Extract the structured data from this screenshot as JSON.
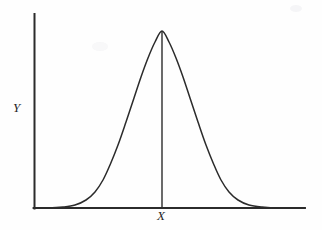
{
  "figure": {
    "name": "normal-distribution-curve",
    "background_color": "#fefefe",
    "line_color": "#2b2b2b",
    "width": 322,
    "height": 230
  },
  "labels": {
    "y_axis": "Y",
    "x_axis": "X"
  },
  "chart_data": {
    "type": "line",
    "title": "",
    "subtitle": "",
    "xlabel": "X",
    "ylabel": "Y",
    "legend": [],
    "grid": false,
    "axes": {
      "x_axis_pixel_y": 208,
      "y_axis_pixel_x": 34,
      "x_axis_start_px": 34,
      "x_axis_end_px": 305,
      "y_axis_top_px": 14,
      "y_axis_bottom_px": 208,
      "tick_labels_x": [],
      "tick_labels_y": [],
      "xlim": [
        -4.0,
        4.0
      ],
      "ylim": [
        0,
        1.0
      ]
    },
    "annotations": [
      {
        "name": "mean-vertical-line",
        "description": "vertical line from curve peak down to x-axis at the mean",
        "x": 0.0,
        "y_from": 0.0,
        "y_to": 1.0,
        "pixel_x": 162,
        "pixel_y_top": 31,
        "pixel_y_bottom": 208
      }
    ],
    "series": [
      {
        "name": "normal-density",
        "description": "symmetric bell-shaped normal distribution curve",
        "mean": 0.0,
        "std_dev": 1.0,
        "peak_value": 1.0,
        "x": [
          -4.0,
          -3.6,
          -3.2,
          -2.8,
          -2.4,
          -2.0,
          -1.6,
          -1.2,
          -0.8,
          -0.4,
          0.0,
          0.4,
          0.8,
          1.2,
          1.6,
          2.0,
          2.4,
          2.8,
          3.2,
          3.6,
          4.0
        ],
        "values": [
          0.0003,
          0.0015,
          0.006,
          0.0198,
          0.0561,
          0.1353,
          0.278,
          0.4868,
          0.7261,
          0.9231,
          1.0,
          0.9231,
          0.7261,
          0.4868,
          0.278,
          0.1353,
          0.0561,
          0.0198,
          0.006,
          0.0015,
          0.0003
        ],
        "pixel_path_points": [
          [
            34,
            208
          ],
          [
            48,
            208
          ],
          [
            63,
            207
          ],
          [
            75,
            205
          ],
          [
            86,
            200
          ],
          [
            95,
            192
          ],
          [
            103,
            180
          ],
          [
            110,
            165
          ],
          [
            118,
            145
          ],
          [
            126,
            122
          ],
          [
            134,
            98
          ],
          [
            141,
            77
          ],
          [
            148,
            58
          ],
          [
            155,
            42
          ],
          [
            162,
            31
          ],
          [
            169,
            42
          ],
          [
            176,
            58
          ],
          [
            183,
            77
          ],
          [
            190,
            98
          ],
          [
            198,
            122
          ],
          [
            206,
            145
          ],
          [
            214,
            165
          ],
          [
            221,
            180
          ],
          [
            229,
            192
          ],
          [
            238,
            200
          ],
          [
            249,
            205
          ],
          [
            262,
            207
          ],
          [
            280,
            208
          ],
          [
            305,
            208
          ]
        ]
      }
    ]
  }
}
